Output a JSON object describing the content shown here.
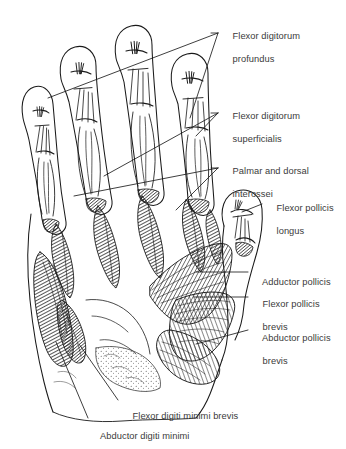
{
  "figure": {
    "type": "anatomical-illustration",
    "background_color": "#ffffff",
    "ink_color": "#1a1a1a",
    "label_color": "#3a3a3a",
    "label_font_size_px": 9.3
  },
  "labels": [
    {
      "id": "flexor-digitorum-profundus",
      "lines": [
        "Flexor digitorum",
        "profundus"
      ],
      "x": 222,
      "y": 25,
      "leader": "long diagonal sweeping left across the four fingers"
    },
    {
      "id": "flexor-digitorum-superficialis",
      "lines": [
        "Flexor digitorum",
        "superficialis"
      ],
      "x": 222,
      "y": 105,
      "leader": "diagonal to mid-finger tendon slips"
    },
    {
      "id": "palmar-and-dorsal-interossei",
      "lines": [
        "Palmar and dorsal",
        "interossei"
      ],
      "x": 222,
      "y": 160,
      "leader": "near-horizontal across the metacarpal interspaces"
    },
    {
      "id": "flexor-pollicis-longus",
      "lines": [
        "Flexor pollicis",
        "longus"
      ],
      "x": 266,
      "y": 196,
      "leader": "short horizontal into the thumb tendon"
    },
    {
      "id": "adductor-pollicis",
      "lines": [
        "Adductor pollicis"
      ],
      "x": 252,
      "y": 267,
      "leader": "horizontal into the adductor fan"
    },
    {
      "id": "flexor-pollicis-brevis",
      "lines": [
        "Flexor pollicis",
        "brevis"
      ],
      "x": 252,
      "y": 290,
      "leader": "horizontal into the thenar eminence"
    },
    {
      "id": "abductor-pollicis-brevis",
      "lines": [
        "Abductor pollicis",
        "brevis"
      ],
      "x": 252,
      "y": 323,
      "leader": "horizontal into the lateral thenar mass"
    },
    {
      "id": "flexor-digiti-minimi-brevis",
      "lines": [
        "Flexor digiti minimi brevis"
      ],
      "x": 122,
      "y": 404,
      "leader": "diagonal up into the hypothenar eminence"
    },
    {
      "id": "abductor-digiti-minimi",
      "lines": [
        "Abductor digiti minimi"
      ],
      "x": 90,
      "y": 424,
      "leader": "long diagonal up the medial hypothenar border"
    }
  ]
}
